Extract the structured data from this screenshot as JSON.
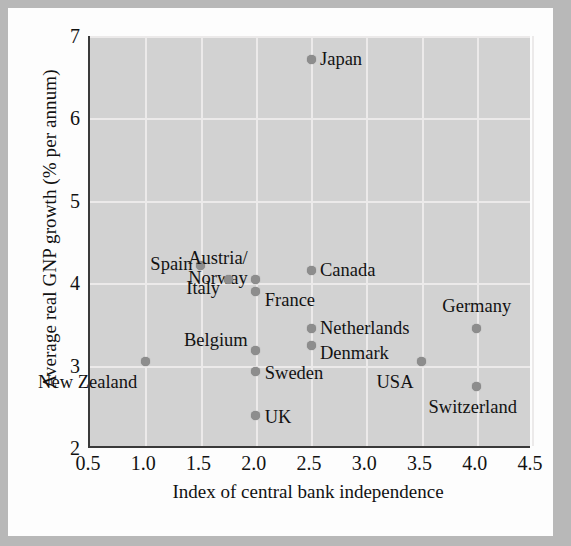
{
  "chart_data": {
    "type": "scatter",
    "title": "",
    "xlabel": "Index of central bank independence",
    "ylabel": "Average real GNP growth (% per annum)",
    "xlim": [
      0.5,
      4.5
    ],
    "ylim": [
      2,
      7
    ],
    "xticks": [
      "0.5",
      "1.0",
      "1.5",
      "2.0",
      "2.5",
      "3.0",
      "3.5",
      "4.0",
      "4.5"
    ],
    "xtick_values": [
      0.5,
      1.0,
      1.5,
      2.0,
      2.5,
      3.0,
      3.5,
      4.0,
      4.5
    ],
    "yticks": [
      "2",
      "3",
      "4",
      "5",
      "6",
      "7"
    ],
    "ytick_values": [
      2,
      3,
      4,
      5,
      6,
      7
    ],
    "grid": true,
    "legend": "none",
    "marker_color": "#8d8d8d",
    "panel_color": "#d2d2d2",
    "grid_color": "#eceaea",
    "points": [
      {
        "label": "Japan",
        "x": 2.5,
        "y": 6.71,
        "anchor": "right",
        "dx": 9,
        "dy": 0
      },
      {
        "label": "Spain",
        "x": 1.5,
        "y": 4.22,
        "anchor": "left",
        "dx": -8,
        "dy": 0
      },
      {
        "label": "Austria/\nNorway",
        "x": 2.0,
        "y": 4.05,
        "anchor": "left",
        "dx": -8,
        "dy": -10
      },
      {
        "label": "Italy",
        "x": 1.75,
        "y": 4.05,
        "anchor": "left",
        "dx": -8,
        "dy": 10
      },
      {
        "label": "Canada",
        "x": 2.5,
        "y": 4.15,
        "anchor": "right",
        "dx": 9,
        "dy": 0
      },
      {
        "label": "France",
        "x": 2.0,
        "y": 3.9,
        "anchor": "right",
        "dx": 9,
        "dy": 10
      },
      {
        "label": "Germany",
        "x": 4.0,
        "y": 3.45,
        "anchor": "center",
        "dx": 0,
        "dy": -22
      },
      {
        "label": "Netherlands",
        "x": 2.5,
        "y": 3.45,
        "anchor": "right",
        "dx": 9,
        "dy": 0
      },
      {
        "label": "Denmark",
        "x": 2.5,
        "y": 3.25,
        "anchor": "right",
        "dx": 9,
        "dy": 9
      },
      {
        "label": "Belgium",
        "x": 2.0,
        "y": 3.18,
        "anchor": "left",
        "dx": -8,
        "dy": -10
      },
      {
        "label": "USA",
        "x": 3.5,
        "y": 3.05,
        "anchor": "left",
        "dx": -8,
        "dy": 22
      },
      {
        "label": "New Zealand",
        "x": 1.0,
        "y": 3.05,
        "anchor": "left",
        "dx": -8,
        "dy": 22
      },
      {
        "label": "Sweden",
        "x": 2.0,
        "y": 2.93,
        "anchor": "right",
        "dx": 9,
        "dy": 3
      },
      {
        "label": "Switzerland",
        "x": 4.0,
        "y": 2.75,
        "anchor": "center",
        "dx": -4,
        "dy": 22
      },
      {
        "label": "UK",
        "x": 2.0,
        "y": 2.4,
        "anchor": "right",
        "dx": 9,
        "dy": 3
      }
    ]
  }
}
